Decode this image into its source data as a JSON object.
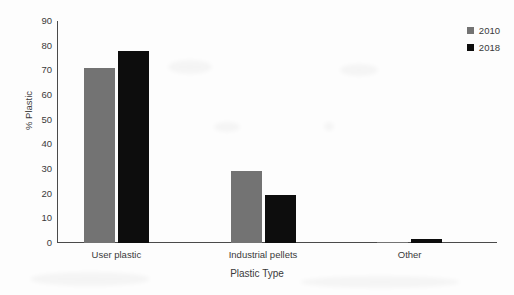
{
  "chart_data": {
    "type": "bar",
    "title": "",
    "subtitle": "",
    "xlabel": "Plastic Type",
    "ylabel": "% Plastic",
    "categories": [
      "User plastic",
      "Industrial pellets",
      "Other"
    ],
    "series": [
      {
        "name": "2010",
        "color": "#737373",
        "values": [
          71,
          29,
          0.3
        ]
      },
      {
        "name": "2018",
        "color": "#0d0d0d",
        "values": [
          78,
          19.5,
          1.5
        ]
      }
    ],
    "ylim": [
      0,
      90
    ],
    "ytick_step": 10,
    "yticks": [
      0,
      10,
      20,
      30,
      40,
      50,
      60,
      70,
      80,
      90
    ],
    "ytick_labels": [
      "0",
      "10",
      "20",
      "30",
      "40",
      "50",
      "60",
      "70",
      "80",
      "90"
    ],
    "grid": false,
    "yaxis_ticks_visible": false,
    "legend_position": "top-right",
    "annotations": [],
    "background_color": "#ffffff",
    "axis_color": "#4a4a4a"
  }
}
